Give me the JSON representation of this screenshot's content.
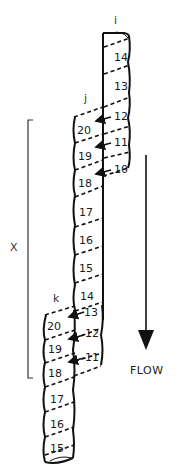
{
  "labels": {
    "i": "i",
    "j": "j",
    "k": "k",
    "x": "X",
    "flow": "FLOW"
  },
  "upper_column": [
    "14",
    "13",
    "12",
    "11",
    "10"
  ],
  "column_j": [
    "20",
    "19",
    "18"
  ],
  "middle_column": [
    "17",
    "16",
    "15",
    "14"
  ],
  "k_right": [
    "13",
    "12",
    "11"
  ],
  "column_k": [
    "20",
    "19",
    "18"
  ],
  "bottom_column": [
    "17",
    "16",
    "15"
  ],
  "colors": {
    "ink": "#111111",
    "background": "#ffffff"
  }
}
